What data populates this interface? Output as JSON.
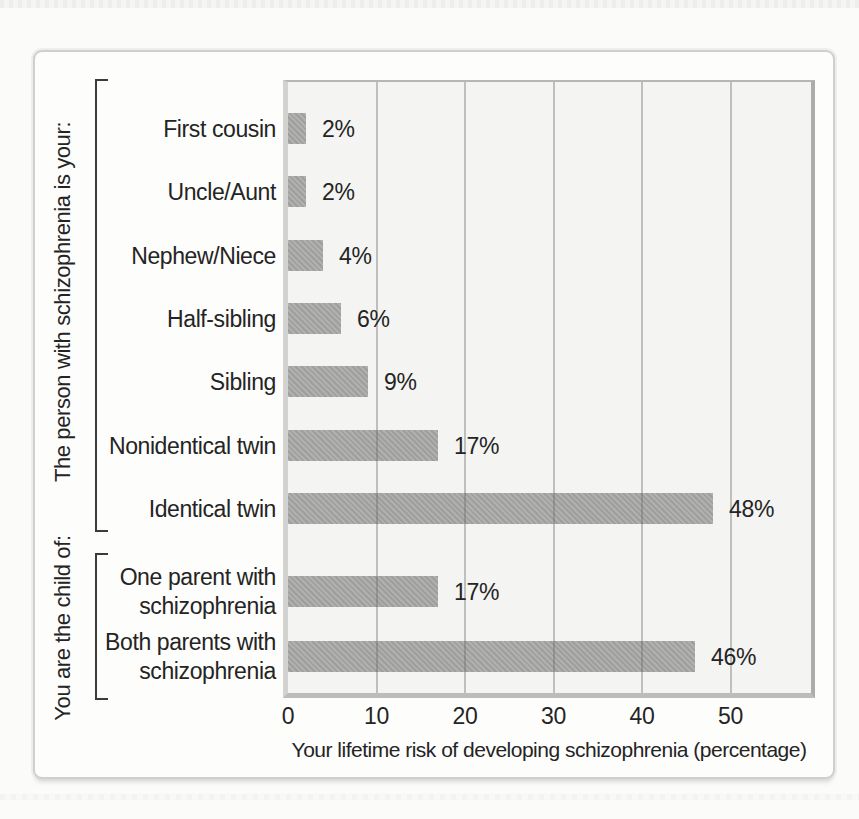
{
  "chart_data": {
    "type": "bar",
    "orientation": "horizontal",
    "title": "",
    "xlabel": "Your lifetime risk of developing schizophrenia (percentage)",
    "x_ticks": [
      "0",
      "10",
      "20",
      "30",
      "40",
      "50"
    ],
    "xlim": [
      0,
      59
    ],
    "gridlines_at": [
      10,
      20,
      30,
      40,
      50
    ],
    "legend": "none",
    "bar_color": "#a7a7a5",
    "plot_background": "#f4f4f2",
    "text_color": "#242424",
    "groups": [
      {
        "label": "The person with schizophrenia is your:",
        "categories": [
          "First cousin",
          "Uncle/Aunt",
          "Nephew/Niece",
          "Half-sibling",
          "Sibling",
          "Nonidentical twin",
          "Identical twin"
        ],
        "values": [
          2,
          2,
          4,
          6,
          9,
          17,
          48
        ],
        "value_labels": [
          "2%",
          "2%",
          "4%",
          "6%",
          "9%",
          "17%",
          "48%"
        ]
      },
      {
        "label": "You are the child of:",
        "categories": [
          "One parent with schizophrenia",
          "Both parents with schizophrenia"
        ],
        "values": [
          17,
          46
        ],
        "value_labels": [
          "17%",
          "46%"
        ]
      }
    ]
  }
}
